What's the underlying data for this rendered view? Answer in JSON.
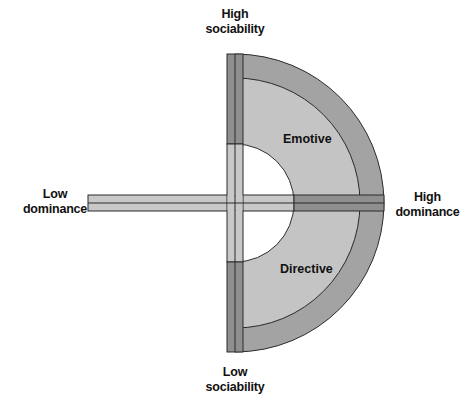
{
  "diagram": {
    "type": "social-style-quadrant",
    "axes": {
      "top": {
        "line1": "High",
        "line2": "sociability"
      },
      "bottom": {
        "line1": "Low",
        "line2": "sociability"
      },
      "left": {
        "line1": "Low",
        "line2": "dominance"
      },
      "right": {
        "line1": "High",
        "line2": "dominance"
      }
    },
    "regions": {
      "upper": "Emotive",
      "lower": "Directive"
    },
    "colors": {
      "outer_ring": "#a3a3a3",
      "inner_ring": "#c4c4c4",
      "bar_light": "#c8c8c8",
      "bar_dark": "#8f8f8f",
      "stroke": "#2a2a2a",
      "center": "#ffffff"
    }
  }
}
